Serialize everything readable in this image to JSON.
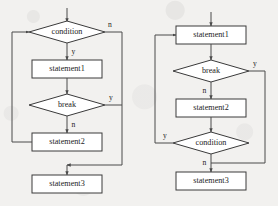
{
  "figure": {
    "type": "flowchart-pair",
    "background_color": "#f2f1ef",
    "line_color": "#4a4a4a",
    "node_fill": "#ffffff"
  },
  "flowcharts": [
    {
      "id": "left",
      "name": "while-loop-with-break",
      "nodes": [
        {
          "id": "l-condition",
          "shape": "diamond",
          "label": "condition"
        },
        {
          "id": "l-statement1",
          "shape": "rectangle",
          "label": "statement1"
        },
        {
          "id": "l-break",
          "shape": "diamond",
          "label": "break"
        },
        {
          "id": "l-statement2",
          "shape": "rectangle",
          "label": "statement2"
        },
        {
          "id": "l-statement3",
          "shape": "rectangle",
          "label": "statement3"
        }
      ],
      "edge_labels": {
        "condition_false": "n",
        "condition_true": "y",
        "break_true": "y",
        "break_false": "n"
      },
      "edges": [
        {
          "from": "entry",
          "to": "l-condition",
          "label": ""
        },
        {
          "from": "l-condition",
          "to": "l-statement1",
          "label": "y"
        },
        {
          "from": "l-condition",
          "to": "l-statement3",
          "label": "n"
        },
        {
          "from": "l-statement1",
          "to": "l-break",
          "label": ""
        },
        {
          "from": "l-break",
          "to": "l-statement3",
          "label": "y"
        },
        {
          "from": "l-break",
          "to": "l-statement2",
          "label": "n"
        },
        {
          "from": "l-statement2",
          "to": "l-condition",
          "label": ""
        }
      ]
    },
    {
      "id": "right",
      "name": "do-while-loop-with-break",
      "nodes": [
        {
          "id": "r-statement1",
          "shape": "rectangle",
          "label": "statement1"
        },
        {
          "id": "r-break",
          "shape": "diamond",
          "label": "break"
        },
        {
          "id": "r-statement2",
          "shape": "rectangle",
          "label": "statement2"
        },
        {
          "id": "r-condition",
          "shape": "diamond",
          "label": "condition"
        },
        {
          "id": "r-statement3",
          "shape": "rectangle",
          "label": "statement3"
        }
      ],
      "edge_labels": {
        "break_true": "y",
        "break_false": "n",
        "condition_true": "y",
        "condition_false": "n"
      },
      "edges": [
        {
          "from": "entry",
          "to": "r-statement1",
          "label": ""
        },
        {
          "from": "r-statement1",
          "to": "r-break",
          "label": ""
        },
        {
          "from": "r-break",
          "to": "r-statement3",
          "label": "y"
        },
        {
          "from": "r-break",
          "to": "r-statement2",
          "label": "n"
        },
        {
          "from": "r-statement2",
          "to": "r-condition",
          "label": ""
        },
        {
          "from": "r-condition",
          "to": "r-statement1",
          "label": "y"
        },
        {
          "from": "r-condition",
          "to": "r-statement3",
          "label": "n"
        }
      ]
    }
  ]
}
